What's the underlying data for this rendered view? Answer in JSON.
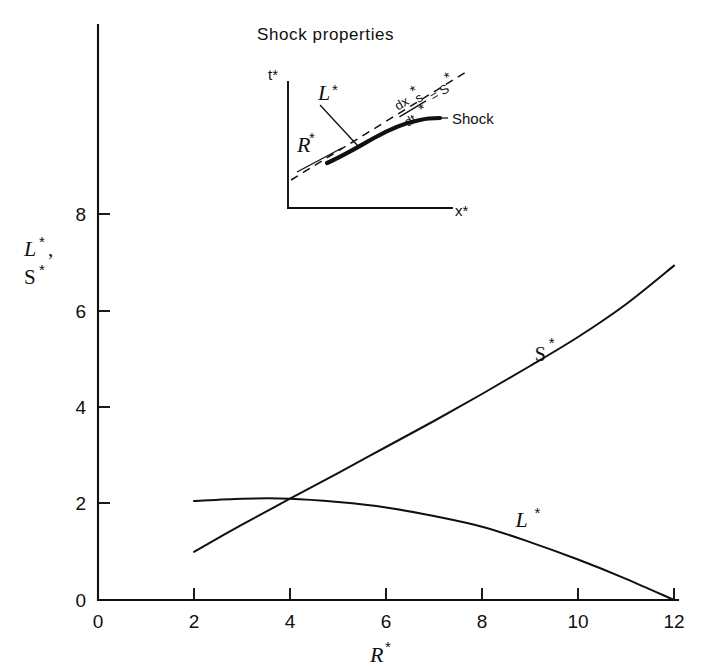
{
  "chart_data": {
    "type": "line",
    "title": "",
    "xlabel": "R*",
    "ylabel": "L*, S*",
    "xlim": [
      0,
      12.4
    ],
    "ylim": [
      0,
      9.2
    ],
    "xticks": [
      0,
      2,
      4,
      6,
      8,
      10,
      12
    ],
    "xtick_labels": [
      "0",
      "2",
      "4",
      "6",
      "8",
      "10",
      "12"
    ],
    "yticks": [
      0,
      2,
      4,
      6,
      8
    ],
    "ytick_labels": [
      "0",
      "2",
      "4",
      "6",
      "8"
    ],
    "grid": false,
    "legend": "inline-labels",
    "series": [
      {
        "name": "S*",
        "label": "S*",
        "label_position": {
          "x": 9.1,
          "y": 4.95
        },
        "x": [
          2.0,
          3.0,
          4.0,
          5.0,
          6.0,
          7.0,
          8.0,
          9.0,
          10.0,
          11.0,
          12.0
        ],
        "values": [
          1.0,
          1.56,
          2.1,
          2.63,
          3.17,
          3.71,
          4.27,
          4.85,
          5.45,
          6.13,
          6.93
        ]
      },
      {
        "name": "L*",
        "label": "L*",
        "label_position": {
          "x": 8.7,
          "y": 1.52
        },
        "x": [
          2.0,
          3.0,
          4.0,
          5.0,
          6.0,
          7.0,
          8.0,
          9.0,
          10.0,
          11.0,
          12.0
        ],
        "values": [
          2.05,
          2.1,
          2.1,
          2.03,
          1.92,
          1.74,
          1.52,
          1.2,
          0.84,
          0.44,
          0.0
        ]
      }
    ],
    "annotations": [
      {
        "name": "crossing-point",
        "x": 4.05,
        "y": 2.1
      }
    ]
  },
  "inset": {
    "title": "Shock properties",
    "y_axis_label": "t*",
    "x_axis_label": "x*",
    "shock_curve_label": "Shock",
    "slope_label_numerator": "dx",
    "slope_label_numerator_sub": "s",
    "slope_label_numerator_star": "*",
    "slope_label_denominator": "dt",
    "slope_label_denominator_star": "*",
    "slope_label_equals": "= S",
    "slope_label_equals_star": "*",
    "characteristic_R_label": "R",
    "characteristic_R_star": "*",
    "characteristic_L_label": "L",
    "characteristic_L_star": "*"
  },
  "axes": {
    "x_title_glyph": "R",
    "x_title_star": "*",
    "y_title_glyph_1": "L",
    "y_title_star_1": "*",
    "y_title_separator": ",",
    "y_title_glyph_2": "S",
    "y_title_star_2": "*"
  },
  "labels": {
    "series_s_glyph": "S",
    "series_s_star": "*",
    "series_l_glyph": "L",
    "series_l_star": "*"
  },
  "colors": {
    "ink": "#101010",
    "background": "#ffffff"
  }
}
